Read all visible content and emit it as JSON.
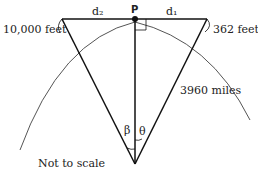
{
  "diagram": {
    "labels": {
      "point": "P",
      "d2": "d₂",
      "d1": "d₁",
      "left_height": "10,000 feet",
      "right_height": "362 feet",
      "radius": "3960 miles",
      "beta": "β",
      "theta": "θ",
      "note": "Not to scale"
    },
    "colors": {
      "stroke": "#111111",
      "arc": "#555555"
    }
  }
}
